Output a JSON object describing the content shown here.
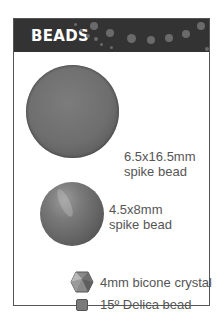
{
  "header": {
    "title": "BEADS",
    "background": "#333333"
  },
  "items": [
    {
      "name": "6.5x16.5mm spike bead",
      "line1": "6.5x16.5mm",
      "line2": "spike bead"
    },
    {
      "name": "4.5x8mm spike bead",
      "line1": "4.5x8mm",
      "line2": "spike bead"
    },
    {
      "name": "4mm bicone crystal",
      "label": "4mm bicone crystal"
    },
    {
      "name": "15° Delica bead",
      "label": "15º Delica bead"
    }
  ]
}
